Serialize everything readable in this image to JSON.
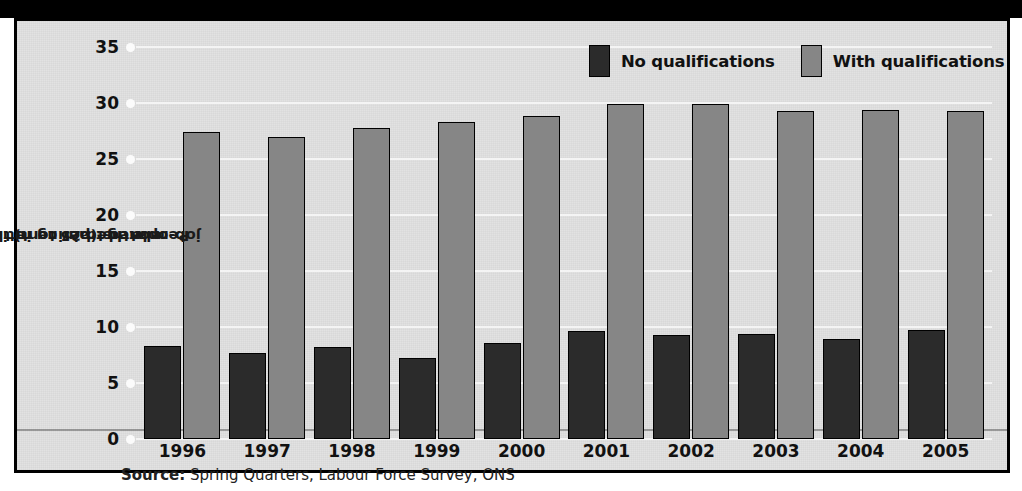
{
  "chart_data": {
    "type": "bar",
    "title": "",
    "xlabel": "",
    "ylabel": "People aged 25 to retirement who received job-related training in the last three months (per cent)",
    "ylabel_lines": [
      "People aged 25 to retirement who received",
      "job-related training in the last three",
      "months (per cent)"
    ],
    "categories": [
      "1996",
      "1997",
      "1998",
      "1999",
      "2000",
      "2001",
      "2002",
      "2003",
      "2004",
      "2005"
    ],
    "series": [
      {
        "name": "No qualifications",
        "color": "#2b2b2b",
        "values": [
          8.3,
          7.7,
          8.2,
          7.2,
          8.6,
          9.6,
          9.3,
          9.4,
          8.9,
          9.7
        ]
      },
      {
        "name": "With qualifications",
        "color": "#868686",
        "values": [
          27.4,
          27.0,
          27.8,
          28.3,
          28.8,
          29.9,
          29.9,
          29.3,
          29.4,
          29.3
        ]
      }
    ],
    "ylim": [
      0,
      35
    ],
    "yticks": [
      0,
      5,
      10,
      15,
      20,
      25,
      30,
      35
    ],
    "ytick_labels": [
      "0",
      "5",
      "10",
      "15",
      "20",
      "25",
      "30",
      "35"
    ],
    "grid": true,
    "legend_position": "top-right"
  },
  "legend": {
    "items": [
      {
        "label": "No qualifications",
        "swatch": "dark-swatch-icon"
      },
      {
        "label": "With qualifications",
        "swatch": "gray-swatch-icon"
      }
    ]
  },
  "source": {
    "prefix": "Source:",
    "text": " Spring Quarters, Labour Force Survey, ONS"
  },
  "colors": {
    "no_qualifications": "#2b2b2b",
    "with_qualifications": "#868686",
    "panel_background": "#e2e2e2",
    "frame": "#000000",
    "gridline": "#f4f4f4"
  }
}
